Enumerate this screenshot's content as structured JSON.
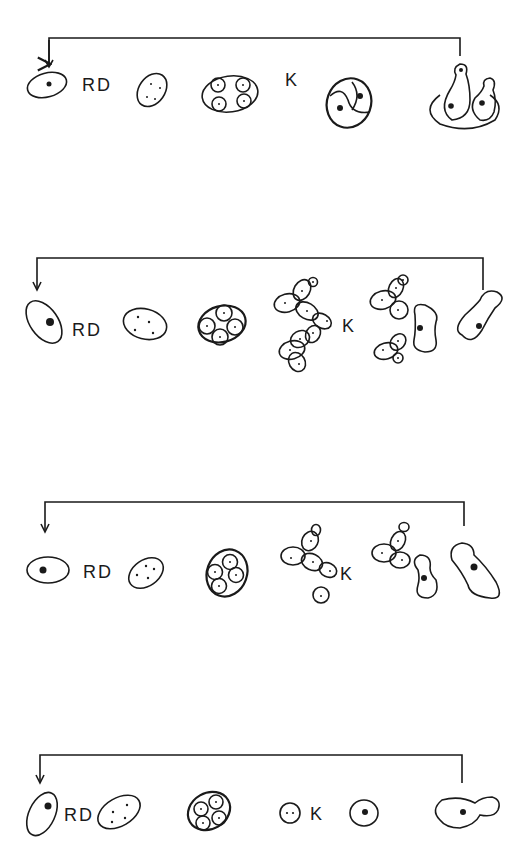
{
  "figure": {
    "rows": [
      {
        "id": 1,
        "label_rd": "RD",
        "label_k": "K"
      },
      {
        "id": 2,
        "label_rd": "RD",
        "label_k": "K"
      },
      {
        "id": 3,
        "label_rd": "RD",
        "label_k": "K"
      },
      {
        "id": 4,
        "label_rd": "RD",
        "label_k": "K"
      }
    ]
  },
  "colors": {
    "ink": "#1a1a1a",
    "background": "#ffffff"
  }
}
